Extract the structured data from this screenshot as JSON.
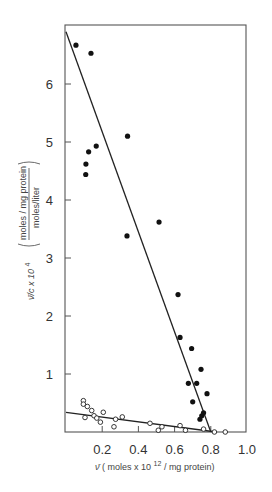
{
  "chart_data": {
    "type": "scatter",
    "title": "",
    "xlabel": "ν̄ (moles x 10^12/mg protein)",
    "ylabel": "ν̄/c x 10^4 (moles/mg protein / moles/liter)",
    "xlim": [
      0,
      1.0
    ],
    "ylim": [
      0,
      7.0
    ],
    "xticks": [
      0.2,
      0.4,
      0.6,
      0.8,
      1.0
    ],
    "xtick_labels": [
      "0.2",
      "0.4",
      "0.6",
      "0.8",
      "1.0"
    ],
    "yticks": [
      1,
      2,
      3,
      4,
      5,
      6
    ],
    "ytick_labels": [
      "1",
      "2",
      "3",
      "4",
      "5",
      "6"
    ],
    "grid": false,
    "legend": null,
    "series": [
      {
        "name": "filled circles",
        "marker": "filled-circle",
        "points": [
          [
            0.055,
            6.67
          ],
          [
            0.138,
            6.53
          ],
          [
            0.34,
            5.1
          ],
          [
            0.167,
            4.93
          ],
          [
            0.125,
            4.83
          ],
          [
            0.11,
            4.62
          ],
          [
            0.109,
            4.44
          ],
          [
            0.514,
            3.62
          ],
          [
            0.337,
            3.38
          ],
          [
            0.619,
            2.37
          ],
          [
            0.63,
            1.63
          ],
          [
            0.694,
            1.44
          ],
          [
            0.746,
            1.08
          ],
          [
            0.676,
            0.84
          ],
          [
            0.722,
            0.84
          ],
          [
            0.779,
            0.66
          ],
          [
            0.7,
            0.52
          ],
          [
            0.74,
            0.22
          ],
          [
            0.75,
            0.28
          ],
          [
            0.76,
            0.33
          ]
        ],
        "fit_line": [
          [
            0.0,
            6.9
          ],
          [
            0.8,
            0.0
          ]
        ]
      },
      {
        "name": "open circles",
        "marker": "open-circle",
        "points": [
          [
            0.096,
            0.54
          ],
          [
            0.096,
            0.48
          ],
          [
            0.118,
            0.44
          ],
          [
            0.142,
            0.37
          ],
          [
            0.105,
            0.25
          ],
          [
            0.155,
            0.28
          ],
          [
            0.17,
            0.24
          ],
          [
            0.206,
            0.34
          ],
          [
            0.19,
            0.17
          ],
          [
            0.274,
            0.22
          ],
          [
            0.311,
            0.26
          ],
          [
            0.265,
            0.09
          ],
          [
            0.464,
            0.15
          ],
          [
            0.53,
            0.09
          ],
          [
            0.51,
            0.03
          ],
          [
            0.63,
            0.11
          ],
          [
            0.66,
            0.03
          ],
          [
            0.76,
            0.05
          ],
          [
            0.82,
            0.0
          ],
          [
            0.88,
            0.0
          ]
        ],
        "fit_line": [
          [
            0.0,
            0.34
          ],
          [
            0.83,
            0.0
          ]
        ]
      }
    ]
  },
  "labels": {
    "x_axis_prefix": "ν̄",
    "x_axis_text": "( moles x 10",
    "x_axis_exp": "12",
    "x_axis_suffix": "/ mg protein)",
    "y_axis_prefix": "ν̄/c  x 10",
    "y_axis_exp": "4",
    "y_axis_numerator": "moles / mg protein",
    "y_axis_denominator": "moles/liter"
  }
}
